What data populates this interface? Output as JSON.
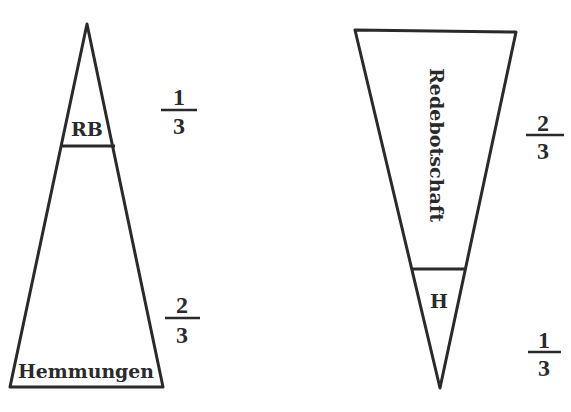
{
  "diagram": {
    "left_triangle": {
      "orientation": "apex-up",
      "top_section_label": "RB",
      "bottom_section_label": "Hemmungen",
      "top_fraction": {
        "numerator": "1",
        "denominator": "3"
      },
      "bottom_fraction": {
        "numerator": "2",
        "denominator": "3"
      }
    },
    "right_triangle": {
      "orientation": "apex-down",
      "top_section_label": "Redebotschaft",
      "bottom_section_label": "H",
      "top_fraction": {
        "numerator": "2",
        "denominator": "3"
      },
      "bottom_fraction": {
        "numerator": "1",
        "denominator": "3"
      }
    },
    "stroke_color": "#2a2a2a",
    "background_color": "#ffffff"
  }
}
